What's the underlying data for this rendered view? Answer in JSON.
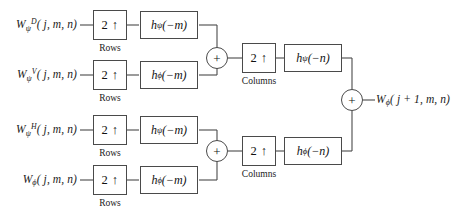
{
  "diagram": {
    "colors": {
      "background": "#ffffff",
      "stroke": "#4a4a4a",
      "text": "#1a1a1a"
    },
    "symbols": {
      "upsample": "2 ↑",
      "adder": "+",
      "psi": "ψ",
      "phi": "ϕ"
    },
    "captions": {
      "rows": "Rows",
      "columns": "Columns"
    },
    "inputs": [
      {
        "id": "wd",
        "base": "W",
        "sub": "ψ",
        "sup": "D",
        "args": "( j, m, n)",
        "plain": "WψD(j, m, n)"
      },
      {
        "id": "wv",
        "base": "W",
        "sub": "ψ",
        "sup": "V",
        "args": "( j, m, n)",
        "plain": "WψV(j, m, n)"
      },
      {
        "id": "wh",
        "base": "W",
        "sub": "ψ",
        "sup": "H",
        "args": "( j, m, n)",
        "plain": "WψH(j, m, n)"
      },
      {
        "id": "wphi",
        "base": "W",
        "sub": "ϕ",
        "sup": "",
        "args": "( j, m, n)",
        "plain": "Wϕ(j, m, n)"
      }
    ],
    "row_upsamplers": [
      {
        "label": "2 ↑",
        "caption": "Rows"
      },
      {
        "label": "2 ↑",
        "caption": "Rows"
      },
      {
        "label": "2 ↑",
        "caption": "Rows"
      },
      {
        "label": "2 ↑",
        "caption": "Rows"
      }
    ],
    "row_filters": [
      {
        "base": "h",
        "sub": "ψ",
        "arg": "(−m)",
        "plain": "hψ(−m)"
      },
      {
        "base": "h",
        "sub": "ϕ",
        "arg": "(−m)",
        "plain": "hϕ(−m)"
      },
      {
        "base": "h",
        "sub": "ψ",
        "arg": "(−m)",
        "plain": "hψ(−m)"
      },
      {
        "base": "h",
        "sub": "ϕ",
        "arg": "(−m)",
        "plain": "hϕ(−m)"
      }
    ],
    "row_adders": [
      {
        "id": "adder-top",
        "label": "+"
      },
      {
        "id": "adder-bottom",
        "label": "+"
      }
    ],
    "col_upsamplers": [
      {
        "label": "2 ↑",
        "caption": "Columns"
      },
      {
        "label": "2 ↑",
        "caption": "Columns"
      }
    ],
    "col_filters": [
      {
        "base": "h",
        "sub": "ψ",
        "arg": "(−n)",
        "plain": "hψ(−n)"
      },
      {
        "base": "h",
        "sub": "ϕ",
        "arg": "(−n)",
        "plain": "hϕ(−n)"
      }
    ],
    "final_adder": {
      "label": "+"
    },
    "output": {
      "base": "W",
      "sub": "ϕ",
      "args": "( j + 1, m, n)",
      "plain": "Wϕ(j + 1, m, n)"
    }
  }
}
